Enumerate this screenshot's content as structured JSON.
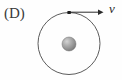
{
  "figure": {
    "panel_label": "(D)",
    "background_color": "#fefefe",
    "width": 122,
    "height": 80,
    "caption_alt": "Panel D: a small particle on a circular orbit around a shaded central sphere, with a velocity arrow v tangent to the orbit pointing to the right."
  },
  "orbit": {
    "name": "circular-orbit-path",
    "center_x": 69,
    "center_y": 43.5,
    "radius": 31,
    "stroke_color": "#4a4a4a",
    "stroke_width": 0.9,
    "fill": "none"
  },
  "central_body": {
    "name": "central-sphere",
    "center_x": 69,
    "center_y": 44,
    "radius": 7,
    "highlight_color": "#cfcfcf",
    "mid_color": "#9a9a9a",
    "edge_color": "#6f6f6f",
    "outline_color": "#707070"
  },
  "orbiting_particle": {
    "name": "orbiting-particle-dot",
    "center_x": 69,
    "center_y": 12.5,
    "size": 3.2,
    "color": "#1c1c1c"
  },
  "velocity_vector": {
    "label": "v",
    "label_x": 112,
    "label_y": 11,
    "start_x": 70,
    "start_y": 12.2,
    "end_x": 103,
    "end_y": 12.2,
    "stroke_color": "#2b2b2b",
    "stroke_width": 1.0,
    "arrowhead_length": 5,
    "arrowhead_half_width": 2.6
  }
}
